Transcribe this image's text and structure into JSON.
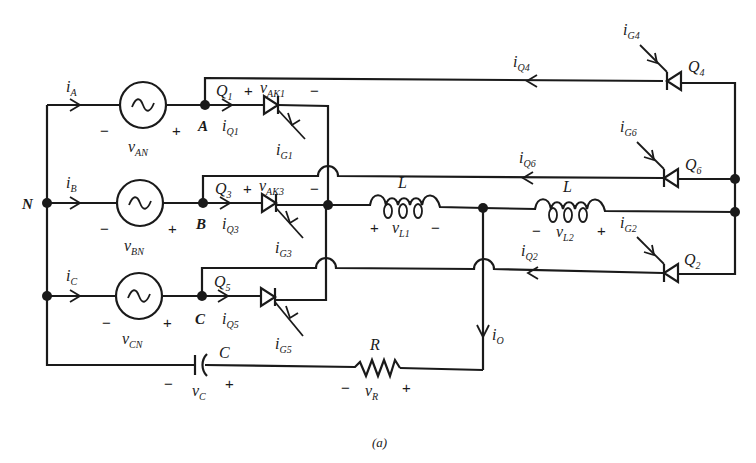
{
  "figure": {
    "caption": "(a)"
  },
  "nodes": {
    "N": "N",
    "A": "A",
    "B": "B",
    "C": "C"
  },
  "sources": [
    {
      "id": "vAN",
      "label": "v",
      "sub": "AN",
      "minus": "−",
      "plus": "+",
      "current": "i",
      "current_sub": "A"
    },
    {
      "id": "vBN",
      "label": "v",
      "sub": "BN",
      "minus": "−",
      "plus": "+",
      "current": "i",
      "current_sub": "B"
    },
    {
      "id": "vCN",
      "label": "v",
      "sub": "CN",
      "minus": "−",
      "plus": "+",
      "current": "i",
      "current_sub": "C"
    }
  ],
  "thyristors": [
    {
      "id": "Q1",
      "name": "Q",
      "name_sub": "1",
      "vak": "v",
      "vak_sub": "AK1",
      "plus": "+",
      "minus": "−",
      "iq": "i",
      "iq_sub": "Q1",
      "ig": "i",
      "ig_sub": "G1"
    },
    {
      "id": "Q3",
      "name": "Q",
      "name_sub": "3",
      "vak": "v",
      "vak_sub": "AK3",
      "plus": "+",
      "minus": "−",
      "iq": "i",
      "iq_sub": "Q3",
      "ig": "i",
      "ig_sub": "G3"
    },
    {
      "id": "Q5",
      "name": "Q",
      "name_sub": "5",
      "iq": "i",
      "iq_sub": "Q5",
      "ig": "i",
      "ig_sub": "G5"
    },
    {
      "id": "Q4",
      "name": "Q",
      "name_sub": "4",
      "iq": "i",
      "iq_sub": "Q4",
      "ig": "i",
      "ig_sub": "G4"
    },
    {
      "id": "Q6",
      "name": "Q",
      "name_sub": "6",
      "iq": "i",
      "iq_sub": "Q6",
      "ig": "i",
      "ig_sub": "G6"
    },
    {
      "id": "Q2",
      "name": "Q",
      "name_sub": "2",
      "iq": "i",
      "iq_sub": "Q2",
      "ig": "i",
      "ig_sub": "G2"
    }
  ],
  "inductors": [
    {
      "id": "L1",
      "label": "L",
      "v": "v",
      "v_sub": "L1",
      "left_sign": "+",
      "right_sign": "−"
    },
    {
      "id": "L2",
      "label": "L",
      "v": "v",
      "v_sub": "L2",
      "left_sign": "−",
      "right_sign": "+"
    }
  ],
  "capacitor": {
    "label": "C",
    "v": "v",
    "v_sub": "C",
    "left_sign": "−",
    "right_sign": "+"
  },
  "resistor": {
    "label": "R",
    "v": "v",
    "v_sub": "R",
    "left_sign": "−",
    "right_sign": "+"
  },
  "output_current": {
    "label": "i",
    "sub": "O"
  }
}
